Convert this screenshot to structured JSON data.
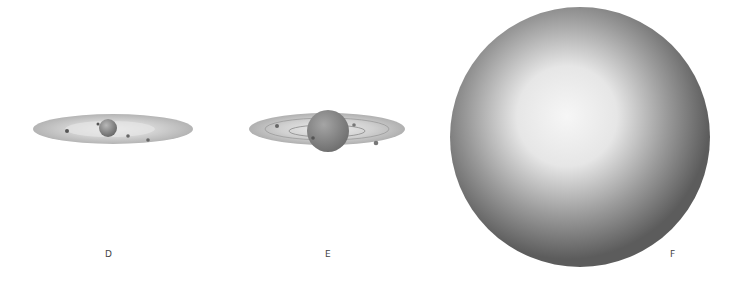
{
  "figure": {
    "panels": [
      {
        "id": "D",
        "label": "D",
        "description": "small central body with thin flat disk and few small bodies"
      },
      {
        "id": "E",
        "label": "E",
        "description": "larger central body with ringed disk and orbiting bodies"
      },
      {
        "id": "F",
        "label": "F",
        "description": "large shaded sphere"
      }
    ]
  },
  "colors": {
    "background": "#ffffff",
    "disk": "#bdbdbd",
    "body": "#8a8a8a",
    "sphere_edge": "#5a5a5a",
    "sphere_highlight": "#f4f4f4"
  }
}
